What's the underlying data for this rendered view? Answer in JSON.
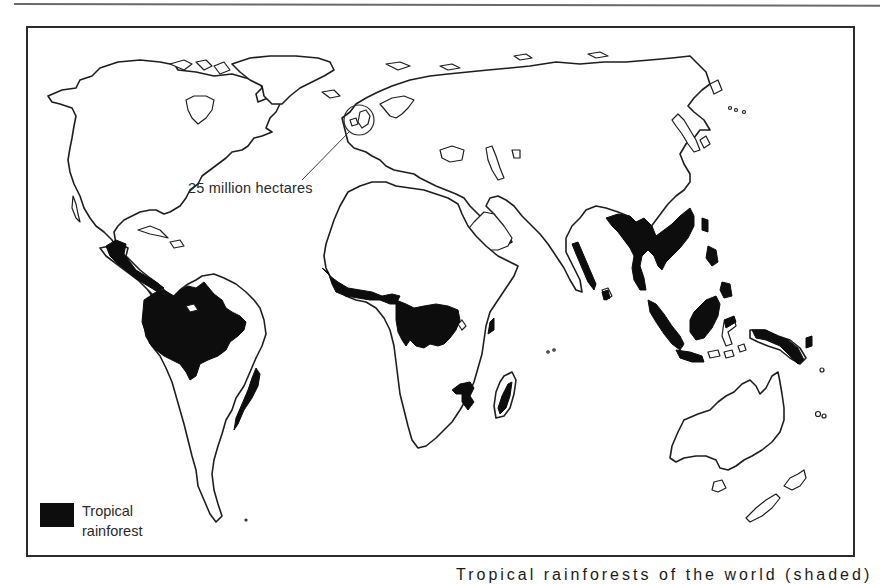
{
  "figure": {
    "type": "world map",
    "annotation": {
      "label": "25 million hectares",
      "callout_target": "British Isles (circled)"
    },
    "legend": {
      "items": [
        {
          "label": "Tropical rainforest",
          "color": "#0d0d0d"
        }
      ]
    },
    "caption_partial": "Tropical rainforests of the world (shaded)"
  },
  "map": {
    "colors": {
      "land_fill": "#ffffff",
      "coastline": "#1e1e1e",
      "rainforest": "#0d0d0d",
      "frame": "#2b2b2b"
    },
    "rainforest_regions": [
      "Central America",
      "Amazon Basin",
      "Atlantic coast of Brazil",
      "West Africa",
      "Congo Basin",
      "East African coast",
      "Madagascar",
      "Western Ghats (India)",
      "Sri Lanka",
      "Southeast Asia",
      "Sumatra",
      "Borneo",
      "Sulawesi",
      "New Guinea",
      "Philippines"
    ]
  }
}
